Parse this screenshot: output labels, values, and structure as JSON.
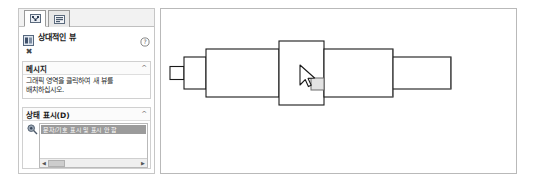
{
  "panel": {
    "tabs": [
      {
        "name": "property-manager-tab",
        "icon": "network-grid-icon",
        "active": true
      },
      {
        "name": "configuration-tab",
        "icon": "list-properties-icon",
        "active": false
      }
    ],
    "title": "상대적인 뷰",
    "title_icon": "relative-view-icon",
    "help_icon": "help-question-icon",
    "close_label": "✖",
    "sections": [
      {
        "key": "message",
        "header": "메시지",
        "chevron": "^",
        "body": "그래픽 영역을 클릭하여 새 뷰를 배치하십시오."
      },
      {
        "key": "display_state",
        "header": "상태 표시(D)",
        "chevron": "^",
        "icon": "display-state-icon",
        "items": [
          "문자/기호 표시 및 표시 안 함"
        ],
        "scroll_left": "◀",
        "scroll_right": "▶"
      }
    ]
  },
  "graphics": {
    "name": "cad-graphics-area",
    "cursor_icon": "arrow-cursor",
    "preview_box": "view-placement-preview",
    "model": "stepped-shaft-profile"
  },
  "colors": {
    "panel_border": "#c6c6c6",
    "selection": "#9b9b9b",
    "line": "#1a1a1a",
    "background": "#ffffff"
  }
}
